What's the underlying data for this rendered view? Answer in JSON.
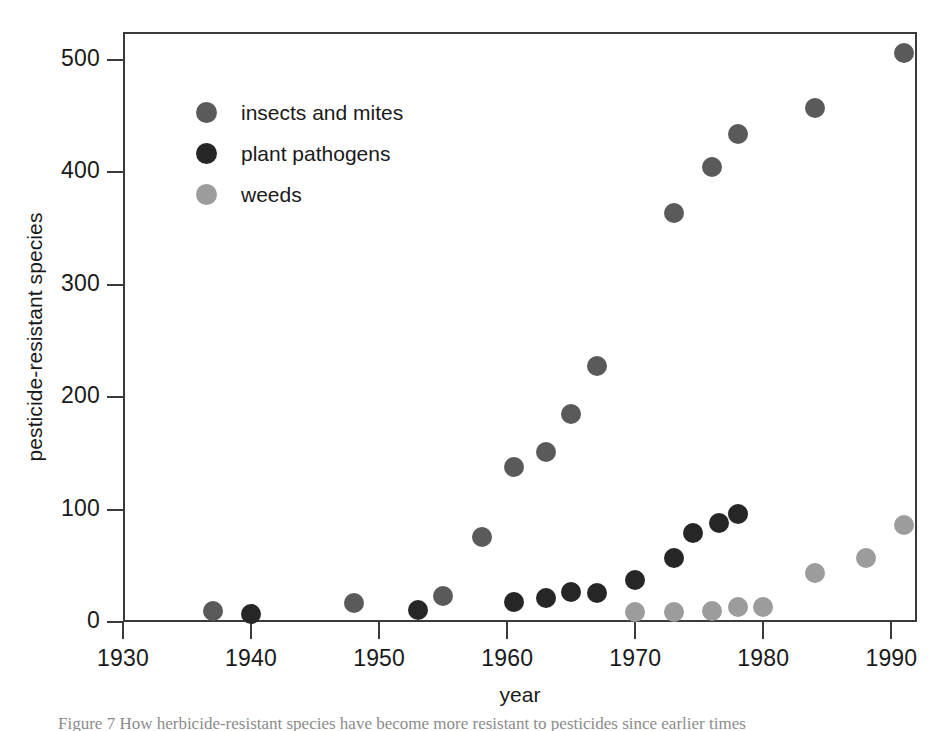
{
  "chart_data": {
    "type": "scatter",
    "title": "",
    "xlabel": "year",
    "ylabel": "pesticide-resistant species",
    "xlim": [
      1930,
      1992
    ],
    "ylim": [
      0,
      520
    ],
    "xticks": [
      1930,
      1940,
      1950,
      1960,
      1970,
      1980,
      1990
    ],
    "xtick_labels": [
      "1930",
      "1940",
      "1950",
      "1960",
      "1970",
      "1980",
      "1990"
    ],
    "yticks": [
      0,
      100,
      200,
      300,
      400,
      500
    ],
    "ytick_labels": [
      "0",
      "100",
      "200",
      "300",
      "400",
      "500"
    ],
    "grid": false,
    "legend_position": "upper-left-inside",
    "series": [
      {
        "name": "insects and mites",
        "color": "#5a5a5a",
        "points": [
          {
            "x": 1937,
            "y": 10
          },
          {
            "x": 1948,
            "y": 17
          },
          {
            "x": 1955,
            "y": 23
          },
          {
            "x": 1958,
            "y": 76
          },
          {
            "x": 1960.5,
            "y": 138
          },
          {
            "x": 1963,
            "y": 151
          },
          {
            "x": 1965,
            "y": 185
          },
          {
            "x": 1967,
            "y": 228
          },
          {
            "x": 1973,
            "y": 364
          },
          {
            "x": 1976,
            "y": 405
          },
          {
            "x": 1978,
            "y": 434
          },
          {
            "x": 1984,
            "y": 457
          },
          {
            "x": 1991,
            "y": 506
          }
        ]
      },
      {
        "name": "plant pathogens",
        "color": "#262626",
        "points": [
          {
            "x": 1940,
            "y": 7
          },
          {
            "x": 1953,
            "y": 11
          },
          {
            "x": 1960.5,
            "y": 18
          },
          {
            "x": 1963,
            "y": 21
          },
          {
            "x": 1965,
            "y": 27
          },
          {
            "x": 1967,
            "y": 26
          },
          {
            "x": 1970,
            "y": 37
          },
          {
            "x": 1973,
            "y": 57
          },
          {
            "x": 1974.5,
            "y": 79
          },
          {
            "x": 1976.5,
            "y": 88
          },
          {
            "x": 1978,
            "y": 96
          }
        ]
      },
      {
        "name": "weeds",
        "color": "#9c9c9c",
        "points": [
          {
            "x": 1970,
            "y": 9
          },
          {
            "x": 1973,
            "y": 9
          },
          {
            "x": 1976,
            "y": 10
          },
          {
            "x": 1978,
            "y": 13
          },
          {
            "x": 1980,
            "y": 13
          },
          {
            "x": 1984,
            "y": 44
          },
          {
            "x": 1988,
            "y": 57
          },
          {
            "x": 1991,
            "y": 86
          }
        ]
      }
    ]
  },
  "legend": {
    "entries": [
      {
        "label": "insects and mites",
        "color": "#5a5a5a"
      },
      {
        "label": "plant pathogens",
        "color": "#262626"
      },
      {
        "label": "weeds",
        "color": "#9c9c9c"
      }
    ]
  },
  "axes": {
    "x_title": "year",
    "y_title": "pesticide-resistant species"
  },
  "caption": "Figure 7  How herbicide-resistant species have become more resistant to pesticides since earlier times"
}
